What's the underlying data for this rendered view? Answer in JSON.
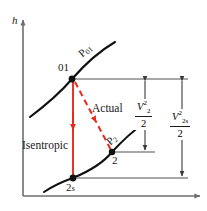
{
  "figure": {
    "axes": {
      "y_label": "h",
      "x_label": ""
    },
    "colors": {
      "curve": "#111111",
      "axis": "#6e6e6e",
      "leader": "#8a8a8a",
      "process_red": "#e8291c",
      "text": "#1a1a1a"
    },
    "points": [
      {
        "id": "01",
        "label": "01",
        "x": 72,
        "y": 79
      },
      {
        "id": "2",
        "label": "2",
        "x": 112,
        "y": 152
      },
      {
        "id": "2s",
        "label": "2",
        "sub": "s",
        "x": 73,
        "y": 178
      }
    ],
    "pressure_curves": [
      {
        "name": "p01",
        "label_main": "P",
        "label_sub": "01"
      },
      {
        "name": "p2",
        "label_main": "P",
        "label_sub": "2"
      }
    ],
    "processes": [
      {
        "name": "isentropic",
        "label": "Isentropic",
        "style": "solid"
      },
      {
        "name": "actual",
        "label": "Actual",
        "style": "dashed"
      }
    ],
    "dimensions": [
      {
        "name": "v2-squared-over-2",
        "numerator_var": "V",
        "numerator_sub": "2",
        "numerator_sup": "2",
        "denominator": "2"
      },
      {
        "name": "v2s-squared-over-2",
        "numerator_var": "V",
        "numerator_sub": "2s",
        "numerator_sup": "2",
        "denominator": "2"
      }
    ]
  }
}
